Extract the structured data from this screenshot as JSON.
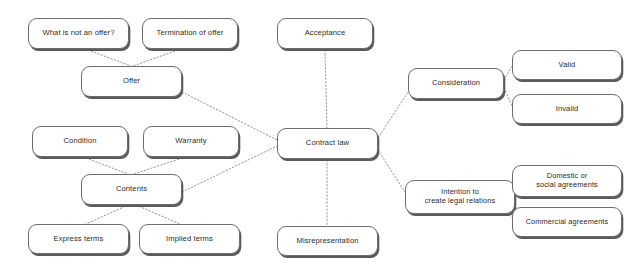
{
  "diagram": {
    "type": "mind-map",
    "canvas": {
      "width": 640,
      "height": 266,
      "background": "#ffffff"
    },
    "style": {
      "node_fill": "#ffffff",
      "node_border": "#6e6e6e",
      "node_shadow": "#5a5a5a",
      "text_color": "#2b2b2b",
      "edge_color": "#8a8a8a",
      "edge_style": "dotted"
    },
    "nodes": [
      {
        "id": "what_is_not_an_offer",
        "label": "What is not an offer?",
        "x": 28,
        "y": 18,
        "w": 101,
        "h": 31,
        "font_size": 7.6
      },
      {
        "id": "termination_of_offer",
        "label": "Termination of offer",
        "x": 142,
        "y": 18,
        "w": 96,
        "h": 31,
        "font_size": 7.6
      },
      {
        "id": "offer",
        "label": "Offer",
        "x": 81,
        "y": 66,
        "w": 101,
        "h": 31,
        "font_size": 7.6
      },
      {
        "id": "condition",
        "label": "Condition",
        "x": 32,
        "y": 126,
        "w": 96,
        "h": 31,
        "font_size": 7.6
      },
      {
        "id": "warranty",
        "label": "Warranty",
        "x": 143,
        "y": 126,
        "w": 96,
        "h": 31,
        "font_size": 7.6
      },
      {
        "id": "contents",
        "label": "Contents",
        "x": 81,
        "y": 174,
        "w": 101,
        "h": 31,
        "font_size": 7.6
      },
      {
        "id": "express_terms",
        "label": "Express terms",
        "x": 28,
        "y": 224,
        "w": 101,
        "h": 30,
        "font_size": 7.6
      },
      {
        "id": "implied_terms",
        "label": "Implied terms",
        "x": 139,
        "y": 224,
        "w": 101,
        "h": 30,
        "font_size": 7.6
      },
      {
        "id": "acceptance",
        "label": "Acceptance",
        "x": 277,
        "y": 18,
        "w": 96,
        "h": 31,
        "font_size": 7.6
      },
      {
        "id": "contract_law",
        "label": "Contract law",
        "x": 277,
        "y": 128,
        "w": 101,
        "h": 31,
        "font_size": 7.6
      },
      {
        "id": "misrepresentation",
        "label": "Misrepresentation",
        "x": 277,
        "y": 226,
        "w": 101,
        "h": 30,
        "font_size": 7.6
      },
      {
        "id": "consideration",
        "label": "Consideration",
        "x": 408,
        "y": 68,
        "w": 96,
        "h": 31,
        "font_size": 7.6
      },
      {
        "id": "valid",
        "label": "Valid",
        "x": 512,
        "y": 50,
        "w": 110,
        "h": 30,
        "font_size": 7.6
      },
      {
        "id": "invalid",
        "label": "Invalid",
        "x": 512,
        "y": 94,
        "w": 110,
        "h": 30,
        "font_size": 7.6
      },
      {
        "id": "intention",
        "label": "Intention to\ncreate legal relations",
        "x": 405,
        "y": 180,
        "w": 110,
        "h": 34,
        "font_size": 7.4
      },
      {
        "id": "domestic_or_social",
        "label": "Domestic or\nsocial agreements",
        "x": 512,
        "y": 165,
        "w": 110,
        "h": 32,
        "font_size": 7.4
      },
      {
        "id": "commercial_agreements",
        "label": "Commercial agreements",
        "x": 512,
        "y": 207,
        "w": 110,
        "h": 30,
        "font_size": 7.4
      }
    ],
    "edges": [
      {
        "from": "what_is_not_an_offer",
        "to": "offer",
        "x1": 88,
        "y1": 50,
        "x2": 131,
        "y2": 66
      },
      {
        "from": "termination_of_offer",
        "to": "offer",
        "x1": 178,
        "y1": 50,
        "x2": 133,
        "y2": 66
      },
      {
        "from": "offer",
        "to": "contract_law",
        "x1": 182,
        "y1": 92,
        "x2": 277,
        "y2": 140
      },
      {
        "from": "condition",
        "to": "contents",
        "x1": 86,
        "y1": 158,
        "x2": 128,
        "y2": 174
      },
      {
        "from": "warranty",
        "to": "contents",
        "x1": 182,
        "y1": 158,
        "x2": 134,
        "y2": 174
      },
      {
        "from": "contents",
        "to": "contract_law",
        "x1": 182,
        "y1": 192,
        "x2": 277,
        "y2": 146
      },
      {
        "from": "contents",
        "to": "express_terms",
        "x1": 128,
        "y1": 205,
        "x2": 86,
        "y2": 224
      },
      {
        "from": "contents",
        "to": "implied_terms",
        "x1": 136,
        "y1": 205,
        "x2": 180,
        "y2": 224
      },
      {
        "from": "acceptance",
        "to": "contract_law",
        "x1": 325,
        "y1": 50,
        "x2": 327,
        "y2": 128
      },
      {
        "from": "contract_law",
        "to": "misrepresentation",
        "x1": 327,
        "y1": 160,
        "x2": 327,
        "y2": 226
      },
      {
        "from": "contract_law",
        "to": "consideration",
        "x1": 378,
        "y1": 138,
        "x2": 408,
        "y2": 92
      },
      {
        "from": "contract_law",
        "to": "intention",
        "x1": 378,
        "y1": 150,
        "x2": 405,
        "y2": 192
      },
      {
        "from": "consideration",
        "to": "valid",
        "x1": 504,
        "y1": 80,
        "x2": 512,
        "y2": 66
      },
      {
        "from": "consideration",
        "to": "invalid",
        "x1": 504,
        "y1": 88,
        "x2": 512,
        "y2": 106
      },
      {
        "from": "intention",
        "to": "domestic_or_social",
        "x1": 515,
        "y1": 190,
        "x2": 512,
        "y2": 182
      },
      {
        "from": "intention",
        "to": "commercial_agreements",
        "x1": 515,
        "y1": 202,
        "x2": 512,
        "y2": 218
      }
    ]
  }
}
